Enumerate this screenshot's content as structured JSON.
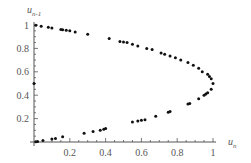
{
  "chart_data": {
    "type": "scatter",
    "title": "",
    "xlabel": "u_n",
    "ylabel": "u_{n-1}",
    "xlabel_main": "u",
    "xlabel_sub": "n",
    "ylabel_main": "u",
    "ylabel_sub": "n-1",
    "xlim": [
      0,
      1.05
    ],
    "ylim": [
      0,
      1.05
    ],
    "xticks": [
      0.2,
      0.4,
      0.6,
      0.8,
      1
    ],
    "xtick_labels": [
      "0.2",
      "0.4",
      "0.6",
      "0.8",
      "1"
    ],
    "yticks": [
      0.2,
      0.4,
      0.6,
      0.8,
      1
    ],
    "ytick_labels": [
      "0.2",
      "0.4",
      "0.6",
      "0.8",
      "1"
    ],
    "grid": false,
    "legend": null,
    "series": [
      {
        "name": "points",
        "points": [
          [
            0.0,
            0.5
          ],
          [
            0.01,
            0.998
          ],
          [
            0.04,
            0.99
          ],
          [
            0.08,
            0.98
          ],
          [
            0.1,
            0.975
          ],
          [
            0.15,
            0.962
          ],
          [
            0.16,
            0.96
          ],
          [
            0.18,
            0.955
          ],
          [
            0.2,
            0.95
          ],
          [
            0.23,
            0.94
          ],
          [
            0.3,
            0.92
          ],
          [
            0.42,
            0.885
          ],
          [
            0.48,
            0.86
          ],
          [
            0.5,
            0.855
          ],
          [
            0.52,
            0.85
          ],
          [
            0.55,
            0.835
          ],
          [
            0.58,
            0.82
          ],
          [
            0.63,
            0.8
          ],
          [
            0.66,
            0.79
          ],
          [
            0.71,
            0.76
          ],
          [
            0.73,
            0.75
          ],
          [
            0.76,
            0.735
          ],
          [
            0.79,
            0.72
          ],
          [
            0.82,
            0.7
          ],
          [
            0.86,
            0.68
          ],
          [
            0.89,
            0.655
          ],
          [
            0.92,
            0.63
          ],
          [
            0.94,
            0.6
          ],
          [
            0.97,
            0.58
          ],
          [
            0.98,
            0.56
          ],
          [
            0.99,
            0.54
          ],
          [
            1.0,
            0.5
          ],
          [
            0.99,
            0.45
          ],
          [
            0.97,
            0.42
          ],
          [
            0.96,
            0.41
          ],
          [
            0.95,
            0.4
          ],
          [
            0.92,
            0.37
          ],
          [
            0.87,
            0.33
          ],
          [
            0.86,
            0.325
          ],
          [
            0.76,
            0.26
          ],
          [
            0.75,
            0.255
          ],
          [
            0.68,
            0.22
          ],
          [
            0.62,
            0.19
          ],
          [
            0.6,
            0.185
          ],
          [
            0.58,
            0.18
          ],
          [
            0.55,
            0.17
          ],
          [
            0.4,
            0.115
          ],
          [
            0.39,
            0.11
          ],
          [
            0.37,
            0.1
          ],
          [
            0.33,
            0.09
          ],
          [
            0.28,
            0.075
          ],
          [
            0.16,
            0.045
          ],
          [
            0.12,
            0.03
          ],
          [
            0.1,
            0.025
          ],
          [
            0.05,
            0.012
          ],
          [
            0.02,
            0.005
          ],
          [
            0.01,
            0.002
          ]
        ]
      }
    ]
  }
}
